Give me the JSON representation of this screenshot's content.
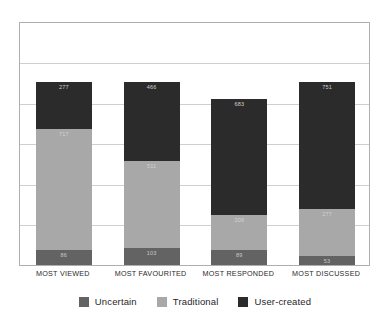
{
  "chart_data": {
    "type": "bar",
    "subtype": "stacked-vertical",
    "title": "",
    "subtitle": "",
    "xlabel": "",
    "ylabel": "",
    "categories": [
      "MOST VIEWED",
      "MOST FAVOURITED",
      "MOST RESPONDED",
      "MOST DISCUSSED"
    ],
    "series": [
      {
        "name": "Uncertain",
        "color": "#636363",
        "values": [
          86,
          103,
          89,
          53
        ]
      },
      {
        "name": "Traditional",
        "color": "#a8a8a8",
        "values": [
          717,
          511,
          206,
          277
        ]
      },
      {
        "name": "User-created",
        "color": "#2b2b2b",
        "values": [
          277,
          466,
          683,
          751
        ]
      }
    ],
    "totals": [
      1080,
      1080,
      978,
      1081
    ],
    "ylim": [
      0,
      1440
    ],
    "grid": true,
    "gridlines": 5,
    "y_tick_labels": [],
    "legend_position": "bottom",
    "bar_labels_shown": true,
    "frame": true
  },
  "legend": {
    "items": [
      {
        "label": "Uncertain",
        "swatch": "legend-swatch-uncertain"
      },
      {
        "label": "Traditional",
        "swatch": "legend-swatch-traditional"
      },
      {
        "label": "User-created",
        "swatch": "legend-swatch-user-created"
      }
    ]
  },
  "colors": {
    "uncertain": "#636363",
    "traditional": "#a8a8a8",
    "user_created": "#2b2b2b",
    "frame": "#aeaeae",
    "grid": "#cfcfcf",
    "background": "#ffffff",
    "axis_text": "#2a2a2a"
  }
}
